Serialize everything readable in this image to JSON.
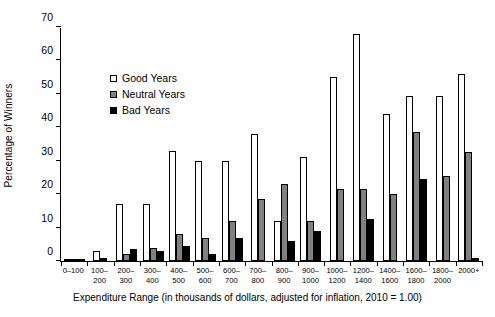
{
  "chart_data": {
    "type": "bar",
    "title": "",
    "xlabel": "Expenditure Range (in thousands of dollars, adjusted for inflation, 2010 = 1.00)",
    "ylabel": "Percentage of Winners",
    "ylim": [
      0,
      70
    ],
    "yticks": [
      0,
      10,
      20,
      30,
      40,
      50,
      60,
      70
    ],
    "grid": false,
    "legend_position": "upper-left-inside",
    "categories": [
      "0–100",
      "100–\n200",
      "200–\n300",
      "300–\n400",
      "400–\n500",
      "500–\n600",
      "600–\n700",
      "700–\n800",
      "800–\n900",
      "900–\n1000",
      "1000–\n1200",
      "1200–\n1400",
      "1400–\n1600",
      "1600–\n1800",
      "1800–\n2000",
      "2000+"
    ],
    "series": [
      {
        "name": "Good Years",
        "color": "#ffffff",
        "values": [
          0.4,
          3.0,
          17.0,
          17.0,
          33.0,
          30.0,
          30.0,
          38.0,
          12.0,
          31.0,
          55.0,
          68.0,
          44.0,
          49.5,
          49.5,
          56.0
        ]
      },
      {
        "name": "Neutral Years",
        "color": "#808080",
        "values": [
          0.4,
          0.0,
          2.0,
          4.0,
          8.0,
          7.0,
          12.0,
          18.5,
          23.0,
          12.0,
          21.5,
          21.5,
          20.0,
          38.5,
          25.5,
          32.5
        ]
      },
      {
        "name": "Bad Years",
        "color": "#000000",
        "values": [
          0.4,
          1.0,
          3.5,
          3.0,
          4.5,
          2.0,
          7.0,
          0.0,
          6.0,
          9.0,
          0.0,
          12.5,
          0.0,
          24.5,
          0.0,
          1.0
        ]
      }
    ]
  },
  "legend": {
    "items": [
      {
        "label": "Good Years",
        "key": "good"
      },
      {
        "label": "Neutral Years",
        "key": "neutral"
      },
      {
        "label": "Bad Years",
        "key": "bad"
      }
    ]
  }
}
